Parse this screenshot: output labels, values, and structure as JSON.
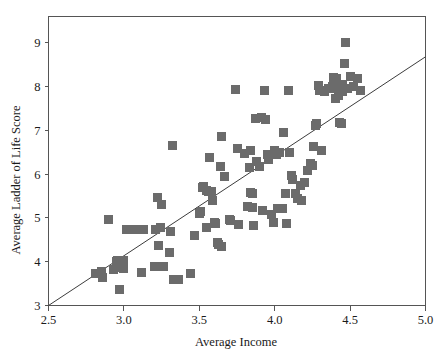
{
  "chart_data": {
    "type": "scatter",
    "title": "",
    "xlabel": "Average Income",
    "ylabel": "Average Ladder of Life Score",
    "xlim": [
      2.5,
      5.0
    ],
    "ylim": [
      3,
      9.6
    ],
    "xticks": [
      "2.5",
      "3.0",
      "3.5",
      "4.0",
      "4.5",
      "5.0"
    ],
    "xtick_values": [
      2.5,
      3.0,
      3.5,
      4.0,
      4.5,
      5.0
    ],
    "yticks": [
      "3",
      "4",
      "5",
      "6",
      "7",
      "8",
      "9"
    ],
    "ytick_values": [
      3,
      4,
      5,
      6,
      7,
      8,
      9
    ],
    "grid": false,
    "legend": null,
    "marker": {
      "shape": "square",
      "color": "#6b6b6b",
      "size_px": 9
    },
    "trend_line": {
      "type": "linear-fit",
      "color": "#3c3c3c",
      "x_start": 2.5,
      "y_start": 3.0,
      "x_end": 5.0,
      "y_end": 8.68
    },
    "n_points": 121,
    "points": [
      [
        2.81,
        3.72
      ],
      [
        2.85,
        3.78
      ],
      [
        2.86,
        3.65
      ],
      [
        2.9,
        4.96
      ],
      [
        2.93,
        3.82
      ],
      [
        2.95,
        4.0
      ],
      [
        2.96,
        4.02
      ],
      [
        2.97,
        3.37
      ],
      [
        2.98,
        3.86
      ],
      [
        3.0,
        4.02
      ],
      [
        3.0,
        3.84
      ],
      [
        3.0,
        4.0
      ],
      [
        3.02,
        4.73
      ],
      [
        3.05,
        4.74
      ],
      [
        3.09,
        4.74
      ],
      [
        3.12,
        3.76
      ],
      [
        3.13,
        4.74
      ],
      [
        3.2,
        3.88
      ],
      [
        3.21,
        4.74
      ],
      [
        3.22,
        5.47
      ],
      [
        3.23,
        4.37
      ],
      [
        3.24,
        4.78
      ],
      [
        3.25,
        5.3
      ],
      [
        3.26,
        3.88
      ],
      [
        3.3,
        4.2
      ],
      [
        3.31,
        4.7
      ],
      [
        3.32,
        6.65
      ],
      [
        3.33,
        3.6
      ],
      [
        3.36,
        3.6
      ],
      [
        3.44,
        3.73
      ],
      [
        3.47,
        4.59
      ],
      [
        3.5,
        5.1
      ],
      [
        3.51,
        5.14
      ],
      [
        3.52,
        5.7
      ],
      [
        3.53,
        5.72
      ],
      [
        3.55,
        5.62
      ],
      [
        3.55,
        4.79
      ],
      [
        3.56,
        5.6
      ],
      [
        3.57,
        6.38
      ],
      [
        3.58,
        5.6
      ],
      [
        3.59,
        5.39
      ],
      [
        3.6,
        4.9
      ],
      [
        3.61,
        4.88
      ],
      [
        3.62,
        4.44
      ],
      [
        3.63,
        4.4
      ],
      [
        3.64,
        6.18
      ],
      [
        3.65,
        4.34
      ],
      [
        3.65,
        6.85
      ],
      [
        3.67,
        5.95
      ],
      [
        3.7,
        4.96
      ],
      [
        3.71,
        4.93
      ],
      [
        3.74,
        7.93
      ],
      [
        3.75,
        6.58
      ],
      [
        3.76,
        4.86
      ],
      [
        3.8,
        6.46
      ],
      [
        3.82,
        5.26
      ],
      [
        3.83,
        6.16
      ],
      [
        3.84,
        5.57
      ],
      [
        3.84,
        6.55
      ],
      [
        3.85,
        5.23
      ],
      [
        3.85,
        5.55
      ],
      [
        3.86,
        4.82
      ],
      [
        3.87,
        7.27
      ],
      [
        3.88,
        6.28
      ],
      [
        3.9,
        6.18
      ],
      [
        3.91,
        7.3
      ],
      [
        3.92,
        5.17
      ],
      [
        3.93,
        7.92
      ],
      [
        3.94,
        7.25
      ],
      [
        3.95,
        6.45
      ],
      [
        3.96,
        6.33
      ],
      [
        3.98,
        5.08
      ],
      [
        3.99,
        4.9
      ],
      [
        4.0,
        6.55
      ],
      [
        4.01,
        6.45
      ],
      [
        4.02,
        5.22
      ],
      [
        4.03,
        6.5
      ],
      [
        4.05,
        5.22
      ],
      [
        4.06,
        6.95
      ],
      [
        4.07,
        5.55
      ],
      [
        4.08,
        4.88
      ],
      [
        4.09,
        7.92
      ],
      [
        4.1,
        6.5
      ],
      [
        4.11,
        5.98
      ],
      [
        4.12,
        5.88
      ],
      [
        4.14,
        5.55
      ],
      [
        4.15,
        5.45
      ],
      [
        4.17,
        5.73
      ],
      [
        4.18,
        5.4
      ],
      [
        4.2,
        5.8
      ],
      [
        4.22,
        6.08
      ],
      [
        4.24,
        6.25
      ],
      [
        4.25,
        6.2
      ],
      [
        4.26,
        6.62
      ],
      [
        4.27,
        7.1
      ],
      [
        4.28,
        7.15
      ],
      [
        4.29,
        8.02
      ],
      [
        4.3,
        7.9
      ],
      [
        4.31,
        6.55
      ],
      [
        4.33,
        7.88
      ],
      [
        4.36,
        7.95
      ],
      [
        4.38,
        8.0
      ],
      [
        4.39,
        8.2
      ],
      [
        4.4,
        7.95
      ],
      [
        4.4,
        7.72
      ],
      [
        4.41,
        8.18
      ],
      [
        4.42,
        7.8
      ],
      [
        4.42,
        8.0
      ],
      [
        4.43,
        7.98
      ],
      [
        4.43,
        7.18
      ],
      [
        4.44,
        7.92
      ],
      [
        4.44,
        7.15
      ],
      [
        4.45,
        7.88
      ],
      [
        4.45,
        8.05
      ],
      [
        4.46,
        8.52
      ],
      [
        4.47,
        9.0
      ],
      [
        4.48,
        7.95
      ],
      [
        4.5,
        8.22
      ],
      [
        4.52,
        8.0
      ],
      [
        4.55,
        8.18
      ],
      [
        4.57,
        7.9
      ]
    ]
  },
  "axis": {
    "x_title": "Average Income",
    "y_title": "Average Ladder of Life Score"
  }
}
